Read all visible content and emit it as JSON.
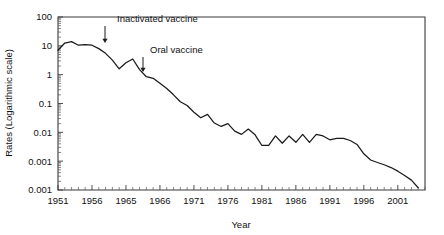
{
  "chart_data": {
    "type": "line",
    "title": "",
    "xlabel": "Year",
    "ylabel": "Rates (Logarithmic scale)",
    "yscale": "log",
    "ylim": [
      0.0001,
      100
    ],
    "xlim": [
      1951,
      2005
    ],
    "grid": false,
    "legend": null,
    "ytick_labels": [
      "100",
      "10",
      "1",
      "0.1",
      "0.01",
      "0.001",
      "0.001"
    ],
    "ytick_values": [
      100,
      10,
      1,
      0.1,
      0.01,
      0.001,
      0.0001
    ],
    "xtick_labels": [
      "1951",
      "1956",
      "1965",
      "1966",
      "1971",
      "1976",
      "1981",
      "1986",
      "1991",
      "1996",
      "2001"
    ],
    "xtick_values": [
      1951,
      1956,
      1961,
      1966,
      1971,
      1976,
      1981,
      1986,
      1991,
      1996,
      2001
    ],
    "series": [
      {
        "name": "Poliomyelitis rate",
        "x": [
          1951,
          1952,
          1953,
          1954,
          1955,
          1956,
          1957,
          1958,
          1959,
          1960,
          1961,
          1962,
          1963,
          1964,
          1965,
          1966,
          1967,
          1968,
          1969,
          1970,
          1971,
          1972,
          1973,
          1974,
          1975,
          1976,
          1977,
          1978,
          1979,
          1980,
          1981,
          1982,
          1983,
          1984,
          1985,
          1986,
          1987,
          1988,
          1989,
          1990,
          1991,
          1992,
          1993,
          1994,
          1995,
          1996,
          1997,
          1998,
          1999,
          2000,
          2001,
          2002,
          2003,
          2004
        ],
        "y": [
          7.0,
          12.5,
          14.0,
          10.5,
          11.0,
          10.5,
          8.0,
          5.5,
          3.2,
          1.6,
          2.6,
          3.5,
          1.5,
          0.85,
          0.75,
          0.5,
          0.33,
          0.2,
          0.115,
          0.085,
          0.05,
          0.032,
          0.042,
          0.021,
          0.016,
          0.02,
          0.011,
          0.0085,
          0.013,
          0.0082,
          0.0035,
          0.0035,
          0.0075,
          0.0042,
          0.0075,
          0.0045,
          0.0085,
          0.0045,
          0.0085,
          0.0075,
          0.0055,
          0.0062,
          0.0062,
          0.0052,
          0.0038,
          0.0018,
          0.0011,
          0.0009,
          0.00075,
          0.0006,
          0.00045,
          0.00032,
          0.00022,
          0.00012
        ]
      }
    ],
    "annotations": [
      {
        "label": "Inactivated vaccine",
        "x": 1955,
        "target_y": 11.0
      },
      {
        "label": "Oral vaccine",
        "x": 1962,
        "target_y": 3.5
      }
    ]
  }
}
